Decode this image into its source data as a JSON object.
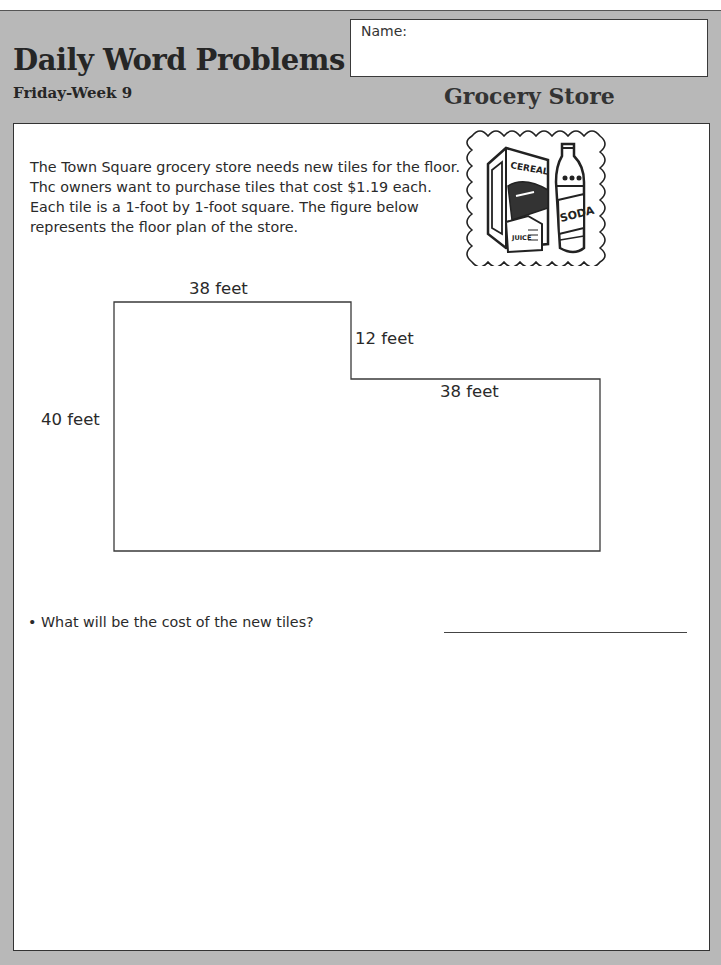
{
  "header": {
    "title": "Daily Word Problems",
    "subtitle": "Friday-Week 9",
    "name_label": "Name:",
    "topic": "Grocery Store"
  },
  "problem": {
    "intro": "The Town Square grocery store needs new tiles for the floor. Thc owners want to purchase tiles that cost $1.19 each. Each tile is a 1-foot by 1-foot square. The figure below represents the floor plan of the store.",
    "clipart": {
      "icon": "cereal-box-and-soda-bottle-icon",
      "labels": [
        "CEREAL",
        "SODA",
        "JUICE"
      ]
    },
    "floor_plan": {
      "top_width": "38 feet",
      "step_height": "12 feet",
      "lower_right_width": "38 feet",
      "left_height": "40 feet"
    },
    "question": "• What will be the cost of the new tiles?"
  },
  "colors": {
    "background_gray": "#b8b8b8",
    "panel_white": "#ffffff",
    "text": "#2a2a2a"
  }
}
